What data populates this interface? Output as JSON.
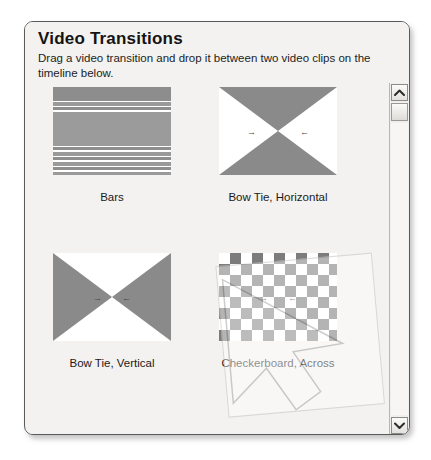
{
  "panel": {
    "title": "Video Transitions",
    "instructions": "Drag a video transition and drop it between two video clips on the timeline below."
  },
  "transitions": [
    {
      "name": "Bars",
      "thumb": "bars-stripes-thumbnail"
    },
    {
      "name": "Bow Tie, Horizontal",
      "thumb": "bowtie-horizontal-thumbnail"
    },
    {
      "name": "Bow Tie, Vertical",
      "thumb": "bowtie-vertical-thumbnail"
    },
    {
      "name": "Checkerboard, Across",
      "thumb": "checkerboard-thumbnail"
    }
  ],
  "scrollbar": {
    "up_glyph": "⌃",
    "down_glyph": "⌄",
    "position": "top"
  },
  "drag_ghost": {
    "label": "drag-preview-overlay"
  },
  "colors": {
    "panel_background": "#f3f2f0",
    "panel_border": "#5a5a5a",
    "thumbnail_shape": "#8a8a8a",
    "text": "#1a1a1a"
  }
}
